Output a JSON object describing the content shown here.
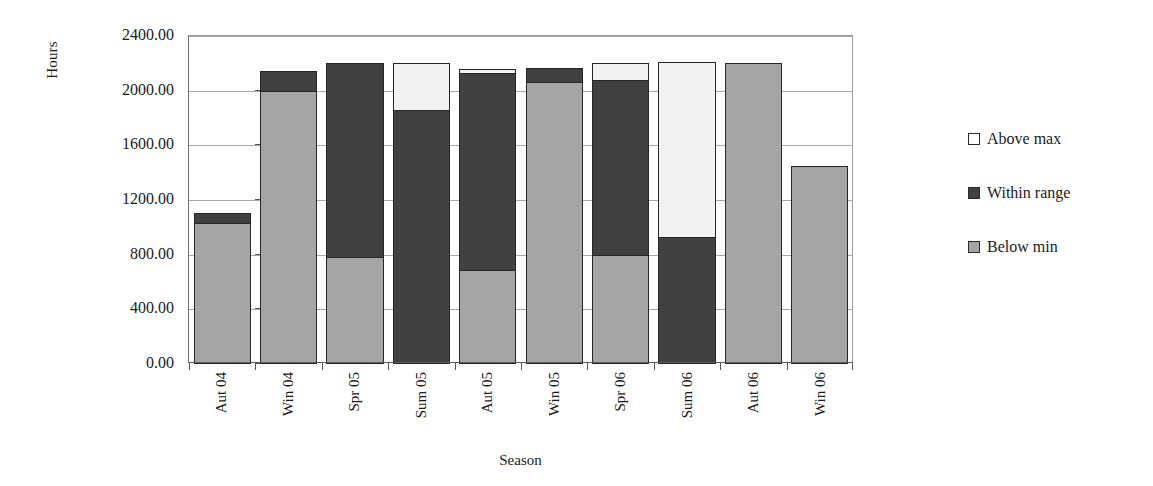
{
  "chart_data": {
    "type": "bar",
    "subtype": "stacked-bar",
    "title": "",
    "xlabel": "Season",
    "ylabel": "Hours",
    "ylim": [
      0,
      2400
    ],
    "yticks": [
      "0.00",
      "400.00",
      "800.00",
      "1200.00",
      "1600.00",
      "2000.00",
      "2400.00"
    ],
    "ytick_values": [
      0,
      400,
      800,
      1200,
      1600,
      2000,
      2400
    ],
    "grid": true,
    "legend_position": "right",
    "categories": [
      "Aut 04",
      "Win 04",
      "Spr 05",
      "Sum 05",
      "Aut 05",
      "Win 05",
      "Spr 06",
      "Sum 06",
      "Aut 06",
      "Win 06"
    ],
    "series": [
      {
        "name": "Below min",
        "color": "#a5a5a5",
        "values": [
          1030,
          2000,
          780,
          0,
          690,
          2060,
          795,
          0,
          2200,
          1450
        ]
      },
      {
        "name": "Within range",
        "color": "#414141",
        "values": [
          80,
          155,
          1430,
          1860,
          1450,
          110,
          1290,
          930,
          0,
          0
        ]
      },
      {
        "name": "Above max",
        "color": "#ffffff",
        "values": [
          0,
          0,
          0,
          350,
          35,
          0,
          135,
          1290,
          0,
          0
        ]
      }
    ],
    "totals": [
      1110,
      2155,
      2210,
      2210,
      2175,
      2170,
      2220,
      2220,
      2200,
      1450
    ]
  },
  "legend": {
    "items": [
      {
        "label": "Above max",
        "swatch": "above"
      },
      {
        "label": "Within range",
        "swatch": "within"
      },
      {
        "label": "Below min",
        "swatch": "below"
      }
    ]
  }
}
